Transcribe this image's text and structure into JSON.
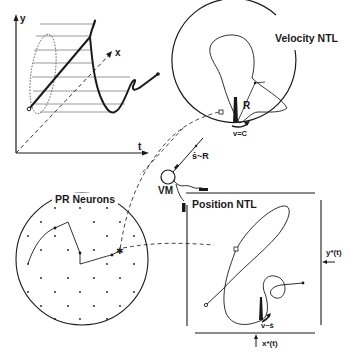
{
  "diagram": {
    "panels": {
      "trajectory_3d": {
        "axis_y": "y",
        "axis_x": "x",
        "axis_t": "t"
      },
      "velocity_ntl": {
        "title": "Velocity NTL",
        "radius_label": "R",
        "velocity_label": "v=C"
      },
      "pr_neurons": {
        "title": "PR Neurons"
      },
      "vm": {
        "label": "VM",
        "connection_label": "ṡ~R"
      },
      "position_ntl": {
        "title": "Position NTL",
        "input_y": "y*(t)",
        "input_x": "x*(t)",
        "velocity_label": "v~ṡ"
      }
    },
    "colors": {
      "ink": "#1a1a1a",
      "background": "#ffffff",
      "grid": "#555555"
    }
  }
}
